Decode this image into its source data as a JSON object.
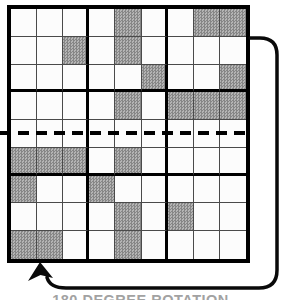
{
  "figure": {
    "caption": "180 DEGREE ROTATION"
  },
  "grid": {
    "rows": 9,
    "cols": 9,
    "shaded_cells_by_row": [
      [
        5,
        8,
        9
      ],
      [
        3,
        5
      ],
      [
        6,
        9
      ],
      [
        5,
        7,
        8,
        9
      ],
      [],
      [
        1,
        2,
        3,
        5
      ],
      [
        1,
        4
      ],
      [
        5,
        7
      ],
      [
        1,
        2,
        5
      ]
    ]
  },
  "colors": {
    "background": "#ffffff",
    "grid_line_thin": "#4a4a4a",
    "grid_line_thick": "#000000",
    "cell_white": "#fcfcfc",
    "cell_shade_dark": "#868686",
    "cell_shade_light": "#b4b4b4",
    "arrow": "#0a0a0a",
    "caption_text": "#a2a2a2"
  }
}
